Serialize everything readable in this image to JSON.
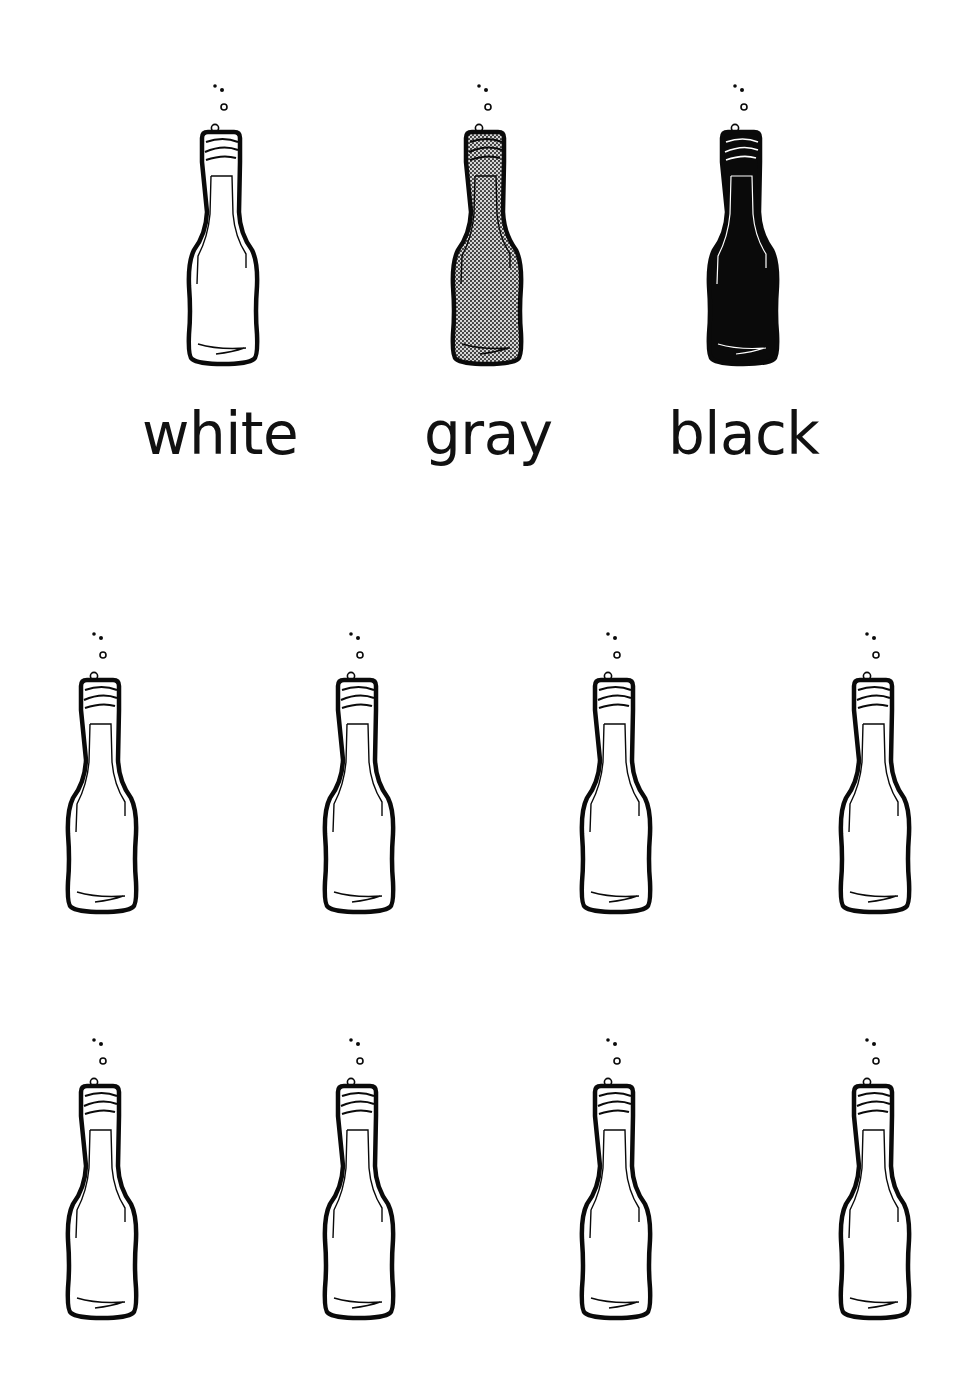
{
  "legend": {
    "items": [
      {
        "label": "white",
        "fill": "#ffffff",
        "pattern": "none"
      },
      {
        "label": "gray",
        "fill": "#9a9a9a",
        "pattern": "halftone-dots"
      },
      {
        "label": "black",
        "fill": "#0a0a0a",
        "pattern": "none"
      }
    ]
  },
  "grid": {
    "rows": 2,
    "columns": 4,
    "bottle_fill": "#ffffff"
  },
  "colors": {
    "outline": "#0a0a0a",
    "background": "#ffffff"
  }
}
